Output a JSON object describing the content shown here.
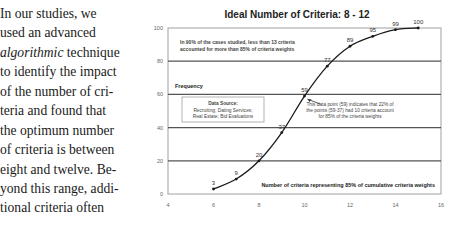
{
  "paragraph": {
    "lines": [
      {
        "parts": [
          {
            "text": "In our studies, we",
            "italic": false
          }
        ]
      },
      {
        "parts": [
          {
            "text": "used an advanced",
            "italic": false
          }
        ]
      },
      {
        "parts": [
          {
            "text": "algorithmic",
            "italic": true
          },
          {
            "text": " technique",
            "italic": false
          }
        ]
      },
      {
        "parts": [
          {
            "text": "to identify the impact",
            "italic": false
          }
        ]
      },
      {
        "parts": [
          {
            "text": "of the number of cri-",
            "italic": false
          }
        ]
      },
      {
        "parts": [
          {
            "text": "teria and found that",
            "italic": false
          }
        ]
      },
      {
        "parts": [
          {
            "text": "the optimum number",
            "italic": false
          }
        ]
      },
      {
        "parts": [
          {
            "text": "of criteria is between",
            "italic": false
          }
        ]
      },
      {
        "parts": [
          {
            "text": "eight and twelve. Be-",
            "italic": false
          }
        ]
      },
      {
        "parts": [
          {
            "text": "yond this range, addi-",
            "italic": false
          }
        ]
      },
      {
        "parts": [
          {
            "text": "tional criteria often",
            "italic": false
          }
        ]
      }
    ]
  },
  "chart_data": {
    "type": "line",
    "title": "Ideal Number of Criteria: 8 - 12",
    "xlabel": "Number of criteria representing 85% of cumulative criteria weights",
    "ylabel": "Frequency",
    "xlim": [
      4,
      16
    ],
    "ylim": [
      0,
      100
    ],
    "x_ticks": [
      4,
      6,
      8,
      10,
      12,
      14,
      16
    ],
    "y_ticks": [
      0,
      20,
      40,
      60,
      80,
      100
    ],
    "grid": "horizontal",
    "legend": "none",
    "series": [
      {
        "name": "Cumulative frequency",
        "x": [
          6,
          7,
          8,
          9,
          10,
          11,
          12,
          13,
          14,
          15
        ],
        "values": [
          3,
          9,
          20,
          37,
          59,
          77,
          89,
          95,
          99,
          100
        ],
        "data_labels": [
          "3",
          "9",
          "20",
          "37",
          "59",
          "77",
          "89",
          "95",
          "99",
          "100"
        ]
      }
    ],
    "annotations": [
      {
        "id": "top-note",
        "lines": [
          "In 90% of the cases studied, less than 13 criteria",
          "accounted for more than 85% of criteria weights"
        ]
      },
      {
        "id": "data-source",
        "lines": [
          "Data Source:",
          "Recruiting; Dating Services;",
          "Real Estate; Bid Evaluations"
        ]
      },
      {
        "id": "point-note",
        "lines": [
          "This data point (59) indicates that 22% of",
          "the points (59-37) had 10 criteria account",
          "for 85% of the criteria weights"
        ]
      }
    ]
  },
  "colors": {
    "line": "#1a1a1a",
    "grid": "#555555",
    "frame": "#a0a0a0",
    "tick_text": "#666666",
    "annotation_text": "#444444",
    "title_text": "#222222"
  }
}
